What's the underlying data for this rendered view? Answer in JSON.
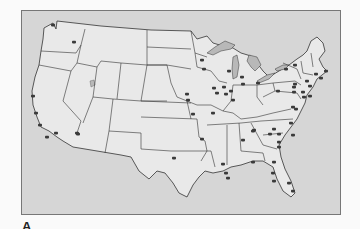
{
  "figure": {
    "panel_label": "A",
    "colors": {
      "background": "#fafafa",
      "ocean": "#d6d6d6",
      "land": "#e9e9e9",
      "border": "#333333",
      "lakes": "#b8b8b8",
      "dots": "#3a3a3a"
    },
    "dots": [
      [
        52,
        24
      ],
      [
        73,
        41
      ],
      [
        32,
        95
      ],
      [
        35,
        112
      ],
      [
        39,
        124
      ],
      [
        55,
        132
      ],
      [
        46,
        136
      ],
      [
        76,
        132
      ],
      [
        77,
        133
      ],
      [
        173,
        157
      ],
      [
        201,
        59
      ],
      [
        203,
        68
      ],
      [
        228,
        70
      ],
      [
        241,
        76
      ],
      [
        242,
        83
      ],
      [
        257,
        82
      ],
      [
        213,
        87
      ],
      [
        216,
        92
      ],
      [
        223,
        86
      ],
      [
        225,
        93
      ],
      [
        230,
        90
      ],
      [
        232,
        99
      ],
      [
        186,
        93
      ],
      [
        187,
        99
      ],
      [
        192,
        113
      ],
      [
        212,
        112
      ],
      [
        201,
        138
      ],
      [
        294,
        64
      ],
      [
        285,
        68
      ],
      [
        294,
        83
      ],
      [
        293,
        86
      ],
      [
        277,
        90
      ],
      [
        293,
        91
      ],
      [
        302,
        91
      ],
      [
        306,
        80
      ],
      [
        309,
        85
      ],
      [
        315,
        73
      ],
      [
        325,
        70
      ],
      [
        320,
        77
      ],
      [
        303,
        96
      ],
      [
        309,
        95
      ],
      [
        292,
        106
      ],
      [
        295,
        108
      ],
      [
        253,
        129
      ],
      [
        252,
        130
      ],
      [
        273,
        128
      ],
      [
        269,
        133
      ],
      [
        290,
        122
      ],
      [
        278,
        133
      ],
      [
        292,
        134
      ],
      [
        242,
        139
      ],
      [
        278,
        141
      ],
      [
        278,
        146
      ],
      [
        252,
        161
      ],
      [
        273,
        161
      ],
      [
        222,
        163
      ],
      [
        225,
        172
      ],
      [
        227,
        177
      ],
      [
        272,
        172
      ],
      [
        273,
        180
      ],
      [
        288,
        182
      ],
      [
        292,
        190
      ]
    ]
  }
}
